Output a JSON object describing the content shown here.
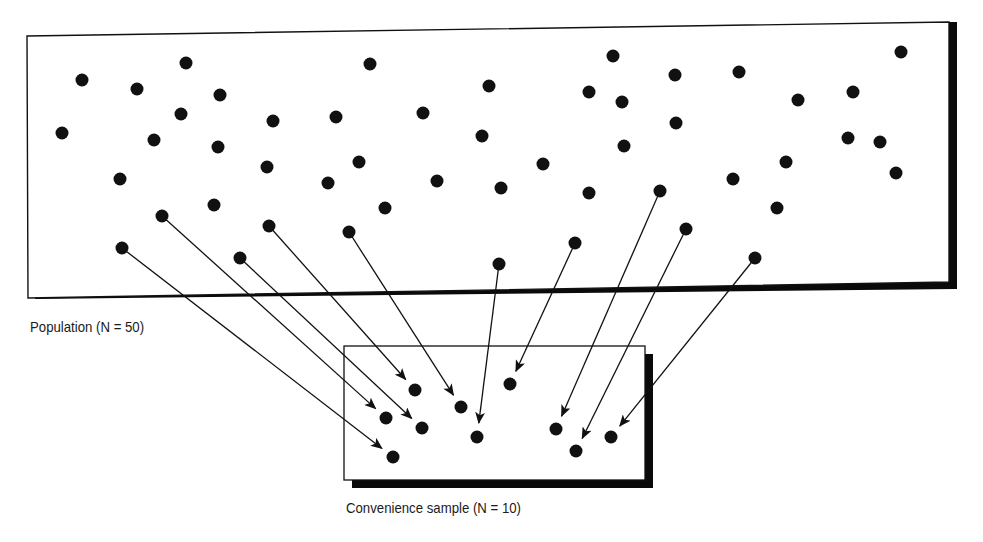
{
  "population": {
    "label": "Population (N = 50)",
    "box": {
      "x": 27,
      "y": 22,
      "w": 922,
      "h": 276,
      "skew_top_right": -8
    },
    "dots": [
      [
        82,
        80
      ],
      [
        186,
        63
      ],
      [
        137,
        89
      ],
      [
        220,
        95
      ],
      [
        181,
        114
      ],
      [
        62,
        133
      ],
      [
        154,
        140
      ],
      [
        218,
        147
      ],
      [
        273,
        121
      ],
      [
        336,
        117
      ],
      [
        370,
        64
      ],
      [
        423,
        113
      ],
      [
        489,
        86
      ],
      [
        482,
        136
      ],
      [
        359,
        162
      ],
      [
        267,
        167
      ],
      [
        120,
        179
      ],
      [
        328,
        183
      ],
      [
        437,
        181
      ],
      [
        214,
        205
      ],
      [
        385,
        208
      ],
      [
        162,
        216
      ],
      [
        269,
        226
      ],
      [
        349,
        232
      ],
      [
        122,
        248
      ],
      [
        240,
        258
      ],
      [
        499,
        264
      ],
      [
        575,
        243
      ],
      [
        589,
        92
      ],
      [
        613,
        56
      ],
      [
        622,
        102
      ],
      [
        675,
        75
      ],
      [
        676,
        123
      ],
      [
        739,
        72
      ],
      [
        798,
        100
      ],
      [
        853,
        92
      ],
      [
        901,
        52
      ],
      [
        848,
        138
      ],
      [
        880,
        142
      ],
      [
        896,
        173
      ],
      [
        786,
        162
      ],
      [
        733,
        179
      ],
      [
        777,
        208
      ],
      [
        660,
        191
      ],
      [
        624,
        146
      ],
      [
        589,
        193
      ],
      [
        543,
        164
      ],
      [
        501,
        188
      ],
      [
        686,
        229
      ],
      [
        755,
        258
      ]
    ]
  },
  "sample": {
    "label": "Convenience sample (N = 10)",
    "box": {
      "x": 344,
      "y": 346,
      "w": 301,
      "h": 134
    },
    "dots": [
      [
        415,
        390
      ],
      [
        386,
        418
      ],
      [
        422,
        428
      ],
      [
        461,
        407
      ],
      [
        477,
        437
      ],
      [
        510,
        384
      ],
      [
        556,
        429
      ],
      [
        576,
        451
      ],
      [
        611,
        437
      ],
      [
        393,
        457
      ]
    ]
  },
  "arrows": [
    {
      "from": [
        122,
        248
      ],
      "to": [
        393,
        457
      ]
    },
    {
      "from": [
        162,
        216
      ],
      "to": [
        386,
        418
      ]
    },
    {
      "from": [
        240,
        258
      ],
      "to": [
        422,
        428
      ]
    },
    {
      "from": [
        269,
        226
      ],
      "to": [
        415,
        390
      ]
    },
    {
      "from": [
        349,
        232
      ],
      "to": [
        461,
        407
      ]
    },
    {
      "from": [
        499,
        264
      ],
      "to": [
        477,
        437
      ]
    },
    {
      "from": [
        575,
        243
      ],
      "to": [
        510,
        384
      ]
    },
    {
      "from": [
        660,
        191
      ],
      "to": [
        556,
        429
      ]
    },
    {
      "from": [
        686,
        229
      ],
      "to": [
        576,
        451
      ]
    },
    {
      "from": [
        755,
        258
      ],
      "to": [
        611,
        437
      ]
    }
  ],
  "colors": {
    "ink": "#111111",
    "background": "#ffffff",
    "shadow": "#0a0a0a"
  }
}
